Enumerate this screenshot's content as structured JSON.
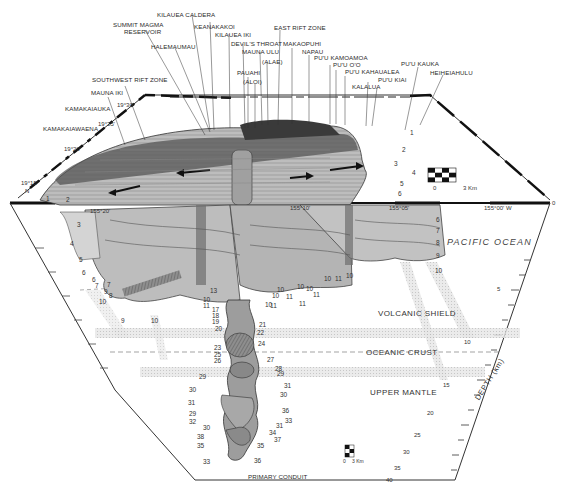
{
  "surface_features": {
    "kilauea_caldera": "KILAUEA CALDERA",
    "summit_magma_reservoir": [
      "SUMMIT MAGMA",
      "RESERVOIR"
    ],
    "keanakakoi": "KEANAKAKOI",
    "kilauea_iki": "KILAUEA IKI",
    "halemaumau": "HALEMAUMAU",
    "devils_throat": "DEVIL'S THROAT",
    "mauna_ulu": "MAUNA ULU",
    "alae": "(ALAE)",
    "pauahi": "PAUAHI",
    "aloi": "(ALOI)",
    "east_rift_zone": "EAST RIFT ZONE",
    "makaopuhi": "MAKAOPUHI",
    "napau": "NAPAU",
    "puu_kamoamoa": "PU'U KAMOAMOA",
    "puu_oo": "PU'U O'O",
    "puu_kahaualea": "PU'U KAHAUALEA",
    "puu_kiai": "PU'U KIAI",
    "kalalua": "KALALUA",
    "puu_kauka": "PU'U KAUKA",
    "heiheiahulu": "HEIHEIAHULU",
    "southwest_rift_zone": "SOUTHWEST RIFT ZONE",
    "mauna_iki": "MAUNA IKI",
    "kamakaiauka": "KAMAKAIAUKA",
    "kamakaiawaena": "KAMAKAIAWAENA"
  },
  "coordinates": {
    "lat_19_30": "19°30'",
    "lat_19_25": "19°25'",
    "lat_19_20": "19°20'",
    "lat_19_15": "19°15'",
    "north": "N",
    "lon_155_20": "155°20'",
    "lon_155_10": "155°10'",
    "lon_155_05": "155°05'",
    "lon_155_00": "155°00' W",
    "origin": "0"
  },
  "zones": {
    "pacific_ocean": "PACIFIC OCEAN",
    "volcanic_shield": "VOLCANIC SHIELD",
    "oceanic_crust": "OCEANIC CRUST",
    "upper_mantle": "UPPER MANTLE",
    "primary_conduit": "PRIMARY CONDUIT"
  },
  "depth_axis": {
    "title": "DEPTH (km)",
    "ticks": [
      "5",
      "10",
      "15",
      "20",
      "25",
      "30",
      "35",
      "40"
    ]
  },
  "scale_bars": [
    {
      "start": "0",
      "end": "3 Km"
    },
    {
      "start": "0",
      "end": "3 Km"
    }
  ],
  "layer_numbers": {
    "left": [
      "1",
      "2",
      "3",
      "4",
      "5",
      "6",
      "6",
      "7",
      "7",
      "9",
      "8",
      "10",
      "9",
      "10"
    ],
    "right": [
      "1",
      "2",
      "3",
      "4",
      "5",
      "6",
      "6",
      "7",
      "8",
      "9",
      "10"
    ],
    "conduit": [
      "13",
      "10",
      "11",
      "17",
      "18",
      "19",
      "20",
      "21",
      "22",
      "23",
      "24",
      "25",
      "26",
      "27",
      "28",
      "29",
      "29",
      "30",
      "30",
      "31",
      "31",
      "29",
      "32",
      "30",
      "36",
      "33",
      "38",
      "35",
      "33",
      "31",
      "37",
      "34",
      "35",
      "36"
    ],
    "mid": [
      "10",
      "11",
      "10",
      "10",
      "11",
      "10",
      "11",
      "10",
      "11",
      "10",
      "11",
      "10"
    ]
  }
}
